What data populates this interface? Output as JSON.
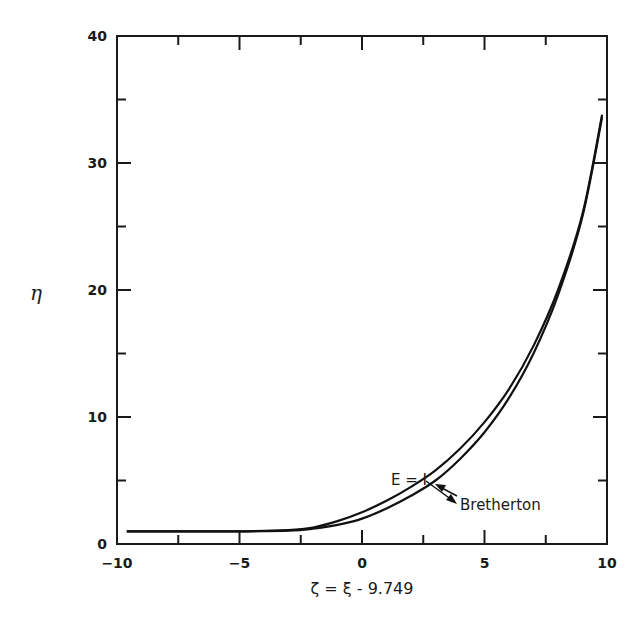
{
  "chart_data": {
    "type": "line",
    "title": "",
    "xlabel": "ζ = ξ - 9.749",
    "ylabel": "η",
    "xlim": [
      -10,
      10
    ],
    "ylim": [
      0,
      40
    ],
    "xticks": [
      "-10",
      "-5",
      "0",
      "5",
      "10"
    ],
    "yticks": [
      "0",
      "10",
      "20",
      "30",
      "40"
    ],
    "grid": false,
    "legend": "none (inline annotations with arrows)",
    "series": [
      {
        "name": "E = 1",
        "x": [
          -9.6,
          -7,
          -5,
          -3,
          -2,
          -1,
          0,
          1,
          2,
          3,
          4,
          5,
          6,
          7,
          8,
          9,
          9.8
        ],
        "y": [
          1.0,
          1.0,
          1.0,
          1.1,
          1.3,
          1.8,
          2.5,
          3.4,
          4.5,
          5.8,
          7.5,
          9.6,
          12.2,
          15.6,
          20.0,
          26.0,
          33.8
        ]
      },
      {
        "name": "Bretherton",
        "x": [
          -9.6,
          -7,
          -5,
          -3,
          -2,
          -1,
          0,
          1,
          2,
          3,
          4,
          5,
          6,
          7,
          8,
          9,
          9.8
        ],
        "y": [
          1.0,
          1.0,
          1.0,
          1.05,
          1.2,
          1.5,
          2.0,
          2.8,
          3.8,
          5.0,
          6.7,
          8.8,
          11.5,
          15.0,
          19.6,
          25.8,
          33.6
        ]
      }
    ],
    "annotations": [
      {
        "text": "E = I",
        "target_series": "E = 1"
      },
      {
        "text": "Bretherton",
        "target_series": "Bretherton"
      }
    ]
  }
}
